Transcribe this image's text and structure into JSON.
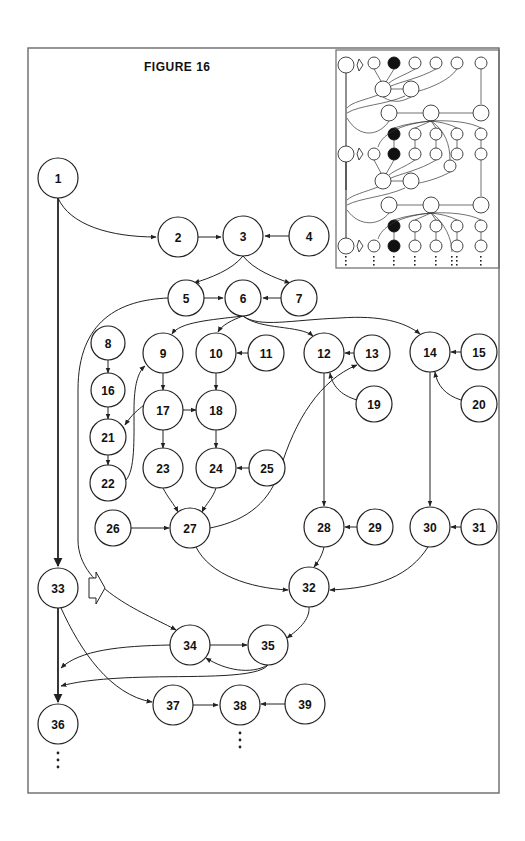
{
  "figure": {
    "title": "FIGURE 16"
  },
  "nodes": [
    {
      "id": "1",
      "label": "1",
      "x": 58,
      "y": 178,
      "r": 20
    },
    {
      "id": "2",
      "label": "2",
      "x": 178,
      "y": 237,
      "r": 20
    },
    {
      "id": "3",
      "label": "3",
      "x": 243,
      "y": 236,
      "r": 20
    },
    {
      "id": "4",
      "label": "4",
      "x": 309,
      "y": 236,
      "r": 20
    },
    {
      "id": "5",
      "label": "5",
      "x": 186,
      "y": 298,
      "r": 18
    },
    {
      "id": "6",
      "label": "6",
      "x": 243,
      "y": 298,
      "r": 18
    },
    {
      "id": "7",
      "label": "7",
      "x": 299,
      "y": 298,
      "r": 18
    },
    {
      "id": "8",
      "label": "8",
      "x": 108,
      "y": 343,
      "r": 17
    },
    {
      "id": "9",
      "label": "9",
      "x": 163,
      "y": 353,
      "r": 20
    },
    {
      "id": "10",
      "label": "10",
      "x": 216,
      "y": 353,
      "r": 20
    },
    {
      "id": "11",
      "label": "11",
      "x": 266,
      "y": 353,
      "r": 18
    },
    {
      "id": "12",
      "label": "12",
      "x": 324,
      "y": 353,
      "r": 20
    },
    {
      "id": "13",
      "label": "13",
      "x": 372,
      "y": 353,
      "r": 18
    },
    {
      "id": "14",
      "label": "14",
      "x": 430,
      "y": 352,
      "r": 20
    },
    {
      "id": "15",
      "label": "15",
      "x": 479,
      "y": 352,
      "r": 18
    },
    {
      "id": "16",
      "label": "16",
      "x": 108,
      "y": 390,
      "r": 17
    },
    {
      "id": "17",
      "label": "17",
      "x": 163,
      "y": 410,
      "r": 20
    },
    {
      "id": "18",
      "label": "18",
      "x": 216,
      "y": 410,
      "r": 20
    },
    {
      "id": "19",
      "label": "19",
      "x": 374,
      "y": 404,
      "r": 18
    },
    {
      "id": "20",
      "label": "20",
      "x": 479,
      "y": 404,
      "r": 18
    },
    {
      "id": "21",
      "label": "21",
      "x": 108,
      "y": 437,
      "r": 18
    },
    {
      "id": "22",
      "label": "22",
      "x": 108,
      "y": 483,
      "r": 18
    },
    {
      "id": "23",
      "label": "23",
      "x": 163,
      "y": 468,
      "r": 20
    },
    {
      "id": "24",
      "label": "24",
      "x": 216,
      "y": 468,
      "r": 20
    },
    {
      "id": "25",
      "label": "25",
      "x": 267,
      "y": 468,
      "r": 18
    },
    {
      "id": "26",
      "label": "26",
      "x": 113,
      "y": 528,
      "r": 18
    },
    {
      "id": "27",
      "label": "27",
      "x": 190,
      "y": 528,
      "r": 20
    },
    {
      "id": "28",
      "label": "28",
      "x": 324,
      "y": 527,
      "r": 20
    },
    {
      "id": "29",
      "label": "29",
      "x": 375,
      "y": 527,
      "r": 18
    },
    {
      "id": "30",
      "label": "30",
      "x": 430,
      "y": 527,
      "r": 20
    },
    {
      "id": "31",
      "label": "31",
      "x": 479,
      "y": 527,
      "r": 18
    },
    {
      "id": "32",
      "label": "32",
      "x": 309,
      "y": 587,
      "r": 20
    },
    {
      "id": "33",
      "label": "33",
      "x": 58,
      "y": 588,
      "r": 20
    },
    {
      "id": "34",
      "label": "34",
      "x": 190,
      "y": 645,
      "r": 20
    },
    {
      "id": "35",
      "label": "35",
      "x": 268,
      "y": 645,
      "r": 20
    },
    {
      "id": "36",
      "label": "36",
      "x": 58,
      "y": 724,
      "r": 20
    },
    {
      "id": "37",
      "label": "37",
      "x": 173,
      "y": 705,
      "r": 20
    },
    {
      "id": "38",
      "label": "38",
      "x": 240,
      "y": 705,
      "r": 20
    },
    {
      "id": "39",
      "label": "39",
      "x": 305,
      "y": 704,
      "r": 20
    }
  ],
  "edges": [
    {
      "from": "1",
      "to": "2"
    },
    {
      "from": "1",
      "to": "33",
      "thick": true
    },
    {
      "from": "2",
      "to": "3"
    },
    {
      "from": "4",
      "to": "3"
    },
    {
      "from": "3",
      "to": "5"
    },
    {
      "from": "3",
      "to": "7"
    },
    {
      "from": "5",
      "to": "6"
    },
    {
      "from": "7",
      "to": "6"
    },
    {
      "from": "5",
      "to": "34"
    },
    {
      "from": "6",
      "to": "9"
    },
    {
      "from": "6",
      "to": "10"
    },
    {
      "from": "6",
      "to": "12"
    },
    {
      "from": "6",
      "to": "14"
    },
    {
      "from": "11",
      "to": "10"
    },
    {
      "from": "13",
      "to": "12"
    },
    {
      "from": "15",
      "to": "14"
    },
    {
      "from": "19",
      "to": "12"
    },
    {
      "from": "20",
      "to": "14"
    },
    {
      "from": "8",
      "to": "16"
    },
    {
      "from": "16",
      "to": "21"
    },
    {
      "from": "21",
      "to": "22"
    },
    {
      "from": "22",
      "to": "9"
    },
    {
      "from": "9",
      "to": "17"
    },
    {
      "from": "10",
      "to": "18"
    },
    {
      "from": "17",
      "to": "18"
    },
    {
      "from": "17",
      "to": "21"
    },
    {
      "from": "17",
      "to": "23"
    },
    {
      "from": "18",
      "to": "24"
    },
    {
      "from": "25",
      "to": "24"
    },
    {
      "from": "23",
      "to": "27"
    },
    {
      "from": "24",
      "to": "27"
    },
    {
      "from": "26",
      "to": "27"
    },
    {
      "from": "27",
      "to": "13"
    },
    {
      "from": "27",
      "to": "32"
    },
    {
      "from": "12",
      "to": "28"
    },
    {
      "from": "14",
      "to": "30"
    },
    {
      "from": "29",
      "to": "28"
    },
    {
      "from": "31",
      "to": "30"
    },
    {
      "from": "28",
      "to": "32"
    },
    {
      "from": "30",
      "to": "32"
    },
    {
      "from": "32",
      "to": "35"
    },
    {
      "from": "34",
      "to": "35"
    },
    {
      "from": "35",
      "to": "34"
    },
    {
      "from": "34",
      "to": "36-line"
    },
    {
      "from": "35",
      "to": "36-line"
    },
    {
      "from": "33",
      "to": "36",
      "thick": true
    },
    {
      "from": "33",
      "to": "37"
    },
    {
      "from": "37",
      "to": "38"
    },
    {
      "from": "39",
      "to": "38"
    }
  ],
  "continuations": [
    {
      "below": "36",
      "symbol": "⋮"
    },
    {
      "below": "38",
      "symbol": "⋮"
    }
  ],
  "block_arrow": {
    "near": "33",
    "direction": "right",
    "icon": "hollow-right-arrow"
  },
  "inset": {
    "description": "Thumbnail overview of the repeating graph structure",
    "filled_nodes_color": "#111111",
    "rows": 3
  }
}
